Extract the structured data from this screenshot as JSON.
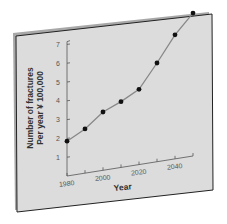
{
  "chart_data": {
    "type": "line",
    "title": "",
    "xlabel": "Year",
    "ylabel": "Number of fractures Per year ¥ 100,000",
    "ylabel_lines": [
      "Number of fractures",
      "Per year ¥ 100,000"
    ],
    "x": [
      1980,
      1990,
      2000,
      2010,
      2020,
      2030,
      2040,
      2050
    ],
    "series": [
      {
        "name": "Fractures",
        "values": [
          1.85,
          2.35,
          3.1,
          3.5,
          4.0,
          5.25,
          6.6,
          7.6
        ]
      }
    ],
    "x_tick_labels": [
      "1980",
      "2000",
      "2020",
      "2040"
    ],
    "y_tick_labels": [
      "1",
      "2",
      "3",
      "4",
      "5",
      "6",
      "7"
    ],
    "xlim": [
      1980,
      2050
    ],
    "ylim": [
      0,
      7
    ],
    "grid": false,
    "legend": "none"
  },
  "colors": {
    "board": "#dcdcdc",
    "board_edge": "#222222",
    "board_shadow": "#9a9a9a",
    "line": "#888888",
    "marker": "#111111",
    "axis": "#555555"
  }
}
